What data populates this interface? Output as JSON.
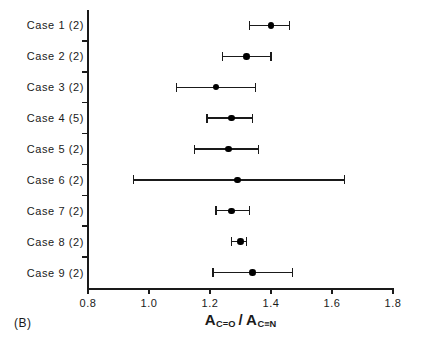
{
  "panel": {
    "label": "(B)"
  },
  "axis_title": {
    "numerator_symbol": "A",
    "numerator_subscript": "C=O",
    "separator": "/",
    "denominator_symbol": "A",
    "denominator_subscript": "C≡N",
    "plain": "A(C=O) / A(C≡N)"
  },
  "colors": {
    "ink": "#1a1a1a",
    "marker": "#000000",
    "background": "#ffffff"
  },
  "chart_data": {
    "type": "scatter",
    "subtype": "forest-plot-errorbar",
    "title": "",
    "subtitle": "",
    "xlabel": "A_C=O / A_C≡N",
    "ylabel": "",
    "xlim": [
      0.8,
      1.8
    ],
    "xticks": [
      0.8,
      1.0,
      1.2,
      1.4,
      1.6,
      1.8
    ],
    "xticklabels": [
      "0.8",
      "1.0",
      "1.2",
      "1.4",
      "1.6",
      "1.8"
    ],
    "grid": false,
    "legend": null,
    "orientation": "horizontal",
    "categories": [
      "Case 1 (2)",
      "Case 2 (2)",
      "Case 3 (2)",
      "Case 4 (5)",
      "Case 5 (2)",
      "Case 6 (2)",
      "Case 7 (2)",
      "Case 8 (2)",
      "Case 9 (2)"
    ],
    "points": [
      {
        "category": "Case 1 (2)",
        "n": 2,
        "value": 1.4,
        "low": 1.33,
        "high": 1.46
      },
      {
        "category": "Case 2 (2)",
        "n": 2,
        "value": 1.32,
        "low": 1.24,
        "high": 1.4
      },
      {
        "category": "Case 3 (2)",
        "n": 2,
        "value": 1.22,
        "low": 1.09,
        "high": 1.35
      },
      {
        "category": "Case 4 (5)",
        "n": 5,
        "value": 1.27,
        "low": 1.19,
        "high": 1.34
      },
      {
        "category": "Case 5 (2)",
        "n": 2,
        "value": 1.26,
        "low": 1.15,
        "high": 1.36
      },
      {
        "category": "Case 6 (2)",
        "n": 2,
        "value": 1.29,
        "low": 0.95,
        "high": 1.64
      },
      {
        "category": "Case 7 (2)",
        "n": 2,
        "value": 1.27,
        "low": 1.22,
        "high": 1.33
      },
      {
        "category": "Case 8 (2)",
        "n": 2,
        "value": 1.3,
        "low": 1.27,
        "high": 1.32
      },
      {
        "category": "Case 9 (2)",
        "n": 2,
        "value": 1.34,
        "low": 1.21,
        "high": 1.47
      }
    ]
  }
}
